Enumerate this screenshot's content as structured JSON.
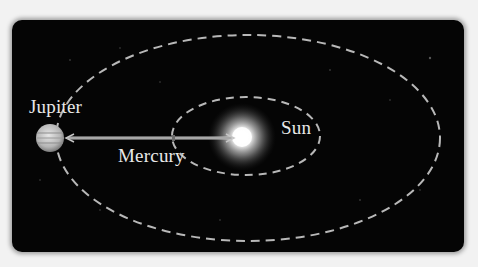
{
  "diagram": {
    "title": "",
    "bodies": [
      {
        "name": "Sun",
        "label": "Sun",
        "cx": 242,
        "cy": 137
      },
      {
        "name": "Jupiter",
        "label": "Jupiter",
        "cx": 50,
        "cy": 138
      },
      {
        "name": "Mercury",
        "label": "Mercury",
        "cx": 174,
        "cy": 138
      }
    ],
    "orbits": [
      {
        "name": "Jupiter orbit",
        "cx": 248,
        "cy": 138,
        "rx": 192,
        "ry": 103,
        "style": "dashed"
      },
      {
        "name": "Mercury orbit",
        "cx": 246,
        "cy": 136,
        "rx": 74,
        "ry": 39,
        "style": "dashed"
      }
    ],
    "arrow": {
      "from": "Jupiter",
      "to": "Sun"
    },
    "labels": {
      "jupiter": "Jupiter",
      "mercury": "Mercury",
      "sun": "Sun"
    },
    "colors": {
      "background": "#050505",
      "orbit": "#b8b8b8",
      "text": "#e8e8e8",
      "page": "#f2f2f2"
    }
  }
}
